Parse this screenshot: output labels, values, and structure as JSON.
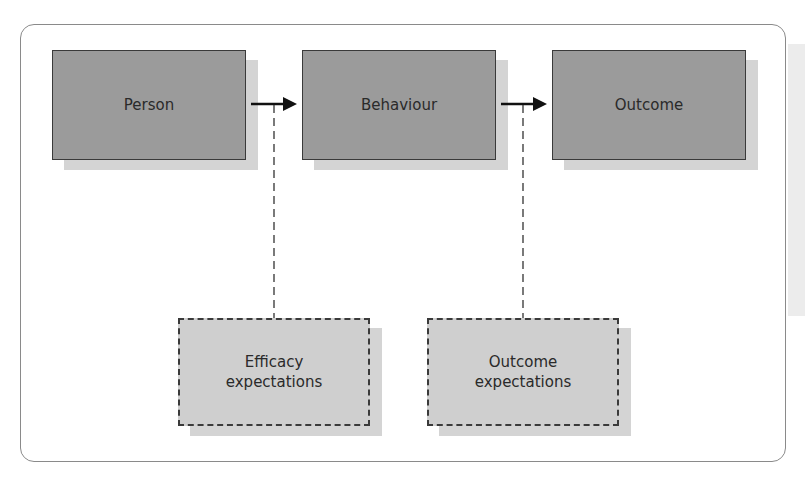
{
  "diagram": {
    "nodes": [
      {
        "id": "person",
        "label": "Person",
        "style": "solid"
      },
      {
        "id": "behaviour",
        "label": "Behaviour",
        "style": "solid"
      },
      {
        "id": "outcome",
        "label": "Outcome",
        "style": "solid"
      },
      {
        "id": "efficacy",
        "label": "Efficacy expectations",
        "line1": "Efficacy",
        "line2": "expectations",
        "style": "dashed"
      },
      {
        "id": "outcome_exp",
        "label": "Outcome expectations",
        "line1": "Outcome",
        "line2": "expectations",
        "style": "dashed"
      }
    ],
    "edges": [
      {
        "from": "person",
        "to": "behaviour",
        "type": "arrow"
      },
      {
        "from": "behaviour",
        "to": "outcome",
        "type": "arrow"
      },
      {
        "from": "efficacy",
        "to": "person-behaviour arrow",
        "type": "dashed-line"
      },
      {
        "from": "outcome_exp",
        "to": "behaviour-outcome arrow",
        "type": "dashed-line"
      }
    ],
    "colors": {
      "solid_fill": "#9b9b9b",
      "dashed_fill": "#cfcfcf",
      "shadow": "#d4d4d4",
      "border": "#3a3a3a",
      "frame": "#8a8a8a"
    }
  }
}
